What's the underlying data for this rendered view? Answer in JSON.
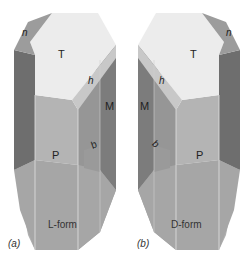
{
  "figure": {
    "panels": [
      {
        "id": "a",
        "caption": "L-form",
        "sublabel": "(a)",
        "faces": {
          "top": "T",
          "upper_small": "n",
          "diagonal": "h",
          "side": "M",
          "front": "P",
          "small_lower": "b"
        }
      },
      {
        "id": "b",
        "caption": "D-form",
        "sublabel": "(b)",
        "faces": {
          "top": "T",
          "upper_small": "n",
          "diagonal": "h",
          "side": "M",
          "front": "P",
          "small_lower": "b"
        }
      }
    ],
    "colors": {
      "top_face": "#ececec",
      "diagonal_face": "#c8c8c8",
      "dark_side": "#6e6e6e",
      "mid_side": "#8c8c8c",
      "front_face": "#a6a6a6",
      "upper_front": "#b4b4b4",
      "lower_bevel": "#b0b0b0",
      "edge_highlight": "#e2e2e2"
    }
  }
}
